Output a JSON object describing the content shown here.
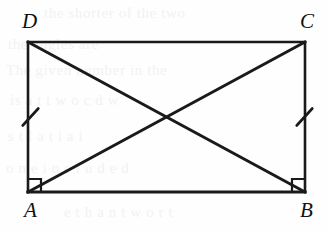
{
  "figure": {
    "kind": "geometry-diagram",
    "shape": "rectangle",
    "name": "Rectangle ABCD with diagonals AC and BD",
    "stroke_color": "#1a1a1a",
    "background_color": "#fefefe",
    "vertices": [
      {
        "id": "A",
        "label": "A",
        "x": 28,
        "y": 192,
        "label_x": 24,
        "label_y": 200
      },
      {
        "id": "B",
        "label": "B",
        "x": 305,
        "y": 192,
        "label_x": 300,
        "label_y": 200
      },
      {
        "id": "C",
        "label": "C",
        "x": 305,
        "y": 42,
        "label_x": 300,
        "label_y": 11
      },
      {
        "id": "D",
        "label": "D",
        "x": 28,
        "y": 42,
        "label_x": 22,
        "label_y": 11
      }
    ],
    "edges": [
      {
        "id": "DC",
        "from": "D",
        "to": "C",
        "width": 2.6
      },
      {
        "id": "CB",
        "from": "C",
        "to": "B",
        "width": 2.6
      },
      {
        "id": "BA",
        "from": "B",
        "to": "A",
        "width": 3.2
      },
      {
        "id": "AD",
        "from": "A",
        "to": "D",
        "width": 2.6
      }
    ],
    "diagonals": [
      {
        "id": "DB",
        "from": "D",
        "to": "B",
        "width": 3.0
      },
      {
        "id": "AC",
        "from": "A",
        "to": "C",
        "width": 3.0
      }
    ],
    "intersection": {
      "label": "",
      "x": 166.5,
      "y": 117
    },
    "right_angle_marks": [
      {
        "id": "angle-A",
        "at": "A",
        "size": 13,
        "corner": "bottom-left"
      },
      {
        "id": "angle-B",
        "at": "B",
        "size": 13,
        "corner": "bottom-right"
      }
    ],
    "congruence_ticks": [
      {
        "id": "tick-AD",
        "on_edge": "AD",
        "count": 1,
        "x": 28,
        "y": 117,
        "length": 20,
        "angle_deg": -58
      },
      {
        "id": "tick-BC",
        "on_edge": "CB",
        "count": 1,
        "x": 305,
        "y": 117,
        "length": 20,
        "angle_deg": -58
      }
    ]
  },
  "ghost_text": [
    {
      "id": "ghost-1",
      "text": "the shorter of the two",
      "x": 44,
      "y": 5
    },
    {
      "id": "ghost-2",
      "text": "the angles are",
      "x": 8,
      "y": 36
    },
    {
      "id": "ghost-3",
      "text": "The given number in the",
      "x": 6,
      "y": 62
    },
    {
      "id": "ghost-4",
      "text": "is a t t w o c d w",
      "x": 10,
      "y": 92
    },
    {
      "id": "ghost-5",
      "text": "s t l a t i a i",
      "x": 8,
      "y": 128
    },
    {
      "id": "ghost-6",
      "text": "o n e i n c l u d e d",
      "x": 6,
      "y": 160
    },
    {
      "id": "ghost-7",
      "text": "e t h a n t w o r t",
      "x": 64,
      "y": 204
    }
  ]
}
